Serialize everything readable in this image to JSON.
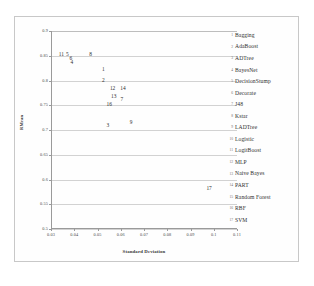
{
  "chart_data": {
    "type": "scatter",
    "title": "",
    "xlabel": "Standard Deviation",
    "ylabel": "RMean",
    "xlim": [
      0.03,
      0.11
    ],
    "ylim": [
      0.5,
      0.9
    ],
    "grid": "horizontal",
    "legend_position": "right",
    "xticks": [
      "0.03",
      "0.04",
      "0.05",
      "0.06",
      "0.07",
      "0.08",
      "0.09",
      "0.1",
      "0.11"
    ],
    "xtick_values": [
      0.03,
      0.04,
      0.05,
      0.06,
      0.07,
      0.08,
      0.09,
      0.1,
      0.11
    ],
    "yticks": [
      "0.9",
      "0.85",
      "0.8",
      "0.75",
      "0.7",
      "0.65",
      "0.6",
      "0.55",
      "0.5"
    ],
    "ytick_values": [
      0.9,
      0.85,
      0.8,
      0.75,
      0.7,
      0.65,
      0.6,
      0.55,
      0.5
    ],
    "point_label_field": "id",
    "points": [
      {
        "id": "11",
        "label": "LogitBoost",
        "x": 0.0345,
        "y": 0.852
      },
      {
        "id": "5",
        "label": "DecisionStump",
        "x": 0.037,
        "y": 0.852
      },
      {
        "id": "6",
        "label": "Decorate",
        "x": 0.0385,
        "y": 0.843
      },
      {
        "id": "4",
        "label": "BayesNet",
        "x": 0.039,
        "y": 0.835
      },
      {
        "id": "8",
        "label": "Kstar",
        "x": 0.047,
        "y": 0.851
      },
      {
        "id": "1",
        "label": "Bagging",
        "x": 0.0525,
        "y": 0.822
      },
      {
        "id": "2",
        "label": "AdaBoost",
        "x": 0.0525,
        "y": 0.799
      },
      {
        "id": "12",
        "label": "MLP",
        "x": 0.0565,
        "y": 0.782
      },
      {
        "id": "14",
        "label": "PART",
        "x": 0.061,
        "y": 0.782
      },
      {
        "id": "13",
        "label": "Naive Bayes",
        "x": 0.057,
        "y": 0.766
      },
      {
        "id": "7",
        "label": "J48",
        "x": 0.0605,
        "y": 0.76
      },
      {
        "id": "16",
        "label": "RBF",
        "x": 0.055,
        "y": 0.751
      },
      {
        "id": "3",
        "label": "ADTree",
        "x": 0.0545,
        "y": 0.709
      },
      {
        "id": "9",
        "label": "LADTree",
        "x": 0.0645,
        "y": 0.715
      },
      {
        "id": "17",
        "label": "SVM",
        "x": 0.098,
        "y": 0.58
      }
    ],
    "legend": [
      {
        "key": "1",
        "label": "Bagging"
      },
      {
        "key": "2",
        "label": "AdaBoost"
      },
      {
        "key": "3",
        "label": "ADTree"
      },
      {
        "key": "4",
        "label": "BayesNet"
      },
      {
        "key": "5",
        "label": "DecisionStump"
      },
      {
        "key": "6",
        "label": "Decorate"
      },
      {
        "key": "7",
        "label": "J48"
      },
      {
        "key": "8",
        "label": "Kstar"
      },
      {
        "key": "9",
        "label": "LADTree"
      },
      {
        "key": "10",
        "label": "Logistic"
      },
      {
        "key": "11",
        "label": "LogitBoost"
      },
      {
        "key": "12",
        "label": "MLP"
      },
      {
        "key": "13",
        "label": "Naive Bayes"
      },
      {
        "key": "14",
        "label": "PART"
      },
      {
        "key": "15",
        "label": "Random Forest"
      },
      {
        "key": "16",
        "label": "RBF"
      },
      {
        "key": "17",
        "label": "SVM"
      }
    ]
  },
  "caption": {
    "text": ""
  },
  "colors": {
    "panel_border": "#c8c8c8",
    "gridline": "#d2d2d2",
    "axis": "#9a9a9a",
    "text": "#2f2f2f"
  }
}
